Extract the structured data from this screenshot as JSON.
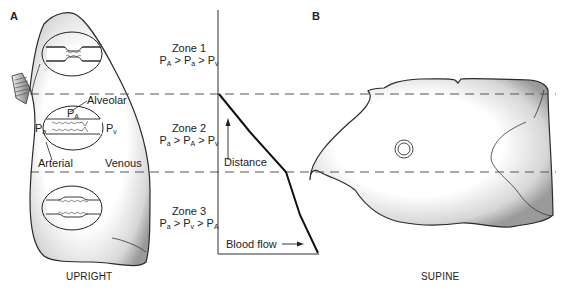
{
  "panels": {
    "a": {
      "letter": "A",
      "caption": "UPRIGHT"
    },
    "b": {
      "letter": "B",
      "caption": "SUPINE"
    }
  },
  "zones": [
    {
      "name": "Zone 1",
      "relation": [
        {
          "p": "P",
          "s": "A"
        },
        {
          "op": " > "
        },
        {
          "p": "P",
          "s": "a"
        },
        {
          "op": " > "
        },
        {
          "p": "P",
          "s": "v"
        }
      ]
    },
    {
      "name": "Zone 2",
      "relation": [
        {
          "p": "P",
          "s": "a"
        },
        {
          "op": " > "
        },
        {
          "p": "P",
          "s": "A"
        },
        {
          "op": " > "
        },
        {
          "p": "P",
          "s": "v"
        }
      ]
    },
    {
      "name": "Zone 3",
      "relation": [
        {
          "p": "P",
          "s": "a"
        },
        {
          "op": " > "
        },
        {
          "p": "P",
          "s": "v"
        },
        {
          "op": " > "
        },
        {
          "p": "P",
          "s": "A"
        }
      ]
    }
  ],
  "alveolus_labels": {
    "alveolar": "Alveolar",
    "pa_alveolar": {
      "p": "P",
      "s": "A"
    },
    "pa_arterial": {
      "p": "P",
      "s": "a"
    },
    "pv_venous": {
      "p": "P",
      "s": "v"
    },
    "arterial": "Arterial",
    "venous": "Venous"
  },
  "graph": {
    "y_axis_label": "Distance",
    "x_axis_label": "Blood flow",
    "curve_description": "Blood flow increases from zero at top of Zone 2 boundary, steeply through Zone 2, then more gradually through Zone 3"
  },
  "colors": {
    "line": "#1a1a1a",
    "dash": "#555555",
    "lung_fill_light": "#ffffff",
    "lung_fill_dark": "#9a9a9a"
  }
}
